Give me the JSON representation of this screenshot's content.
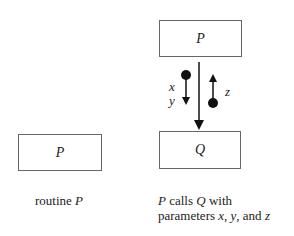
{
  "diagram": {
    "left": {
      "box_label": "P",
      "caption_prefix": "routine ",
      "caption_var": "P"
    },
    "right": {
      "top_box_label": "P",
      "bottom_box_label": "Q",
      "down_params": [
        "x",
        "y"
      ],
      "up_param": "z",
      "caption_line1_a": "P",
      "caption_line1_b": " calls ",
      "caption_line1_c": "Q",
      "caption_line1_d": " with",
      "caption_line2": "parameters ",
      "caption_x": "x",
      "caption_y": "y",
      "caption_and": ", and ",
      "caption_z": "z"
    }
  }
}
